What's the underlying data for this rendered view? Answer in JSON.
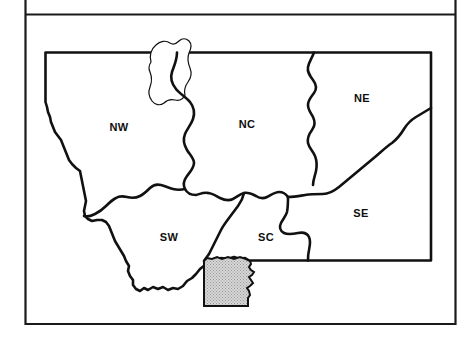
{
  "figure": {
    "title": "",
    "caption": "",
    "background_color": "#ffffff",
    "frame": {
      "outer_line_color": "#1a1a1a",
      "inner_line_color": "#1a1a1a"
    }
  },
  "map": {
    "subject": "Montana",
    "outline_color": "#111111",
    "fill_color": "#ffffff",
    "divider_color": "#111111",
    "regions": [
      {
        "code": "NW",
        "label": "NW",
        "label_x": 119,
        "label_y": 128
      },
      {
        "code": "NC",
        "label": "NC",
        "label_y": 125,
        "label_x": 247
      },
      {
        "code": "NE",
        "label": "NE",
        "label_x": 362,
        "label_y": 99
      },
      {
        "code": "SW",
        "label": "SW",
        "label_x": 169,
        "label_y": 238
      },
      {
        "code": "SC",
        "label": "SC",
        "label_x": 266,
        "label_y": 238
      },
      {
        "code": "SE",
        "label": "SE",
        "label_x": 361,
        "label_y": 214
      }
    ],
    "highlight": {
      "name": "shaded-county",
      "fill_color": "#d0d0d0",
      "pattern": "stipple",
      "stroke_color": "#111111"
    },
    "water_feature": {
      "name": "northern-lake-river",
      "stroke_color": "#111111"
    }
  }
}
